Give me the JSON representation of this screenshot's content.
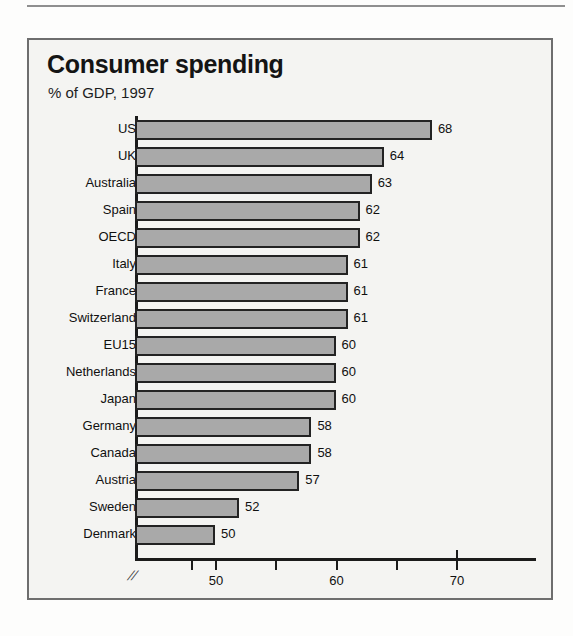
{
  "page": {
    "has_top_rule": true,
    "bleed_through_artifacts": [
      "",
      ""
    ]
  },
  "chart_data": {
    "type": "bar",
    "orientation": "horizontal",
    "title": "Consumer spending",
    "subtitle": "% of GDP, 1997",
    "xlabel": "",
    "ylabel": "",
    "grid": false,
    "legend": null,
    "axis_break": true,
    "axis_break_symbol": "//",
    "xlim": [
      46.8,
      70
    ],
    "xticks": [
      50,
      60,
      70
    ],
    "xtick_labels": [
      "50",
      "60",
      "70"
    ],
    "minor_xticks": [
      48,
      55,
      65
    ],
    "categories": [
      "US",
      "UK",
      "Australia",
      "Spain",
      "OECD",
      "Italy",
      "France",
      "Switzerland",
      "EU15",
      "Netherlands",
      "Japan",
      "Germany",
      "Canada",
      "Austria",
      "Sweden",
      "Denmark"
    ],
    "values": [
      68,
      64,
      63,
      62,
      62,
      61,
      61,
      61,
      60,
      60,
      60,
      58,
      58,
      57,
      52,
      50
    ],
    "value_labels": [
      "68",
      "64",
      "63",
      "62",
      "62",
      "61",
      "61",
      "61",
      "60",
      "60",
      "60",
      "58",
      "58",
      "57",
      "52",
      "50"
    ],
    "colors": {
      "bar_fill": "#a9a9a9",
      "bar_border": "#232323",
      "panel_background": "#f4f4f2",
      "panel_border": "#6e6e6e",
      "axis": "#1b1b1b",
      "text": "#101010"
    }
  }
}
